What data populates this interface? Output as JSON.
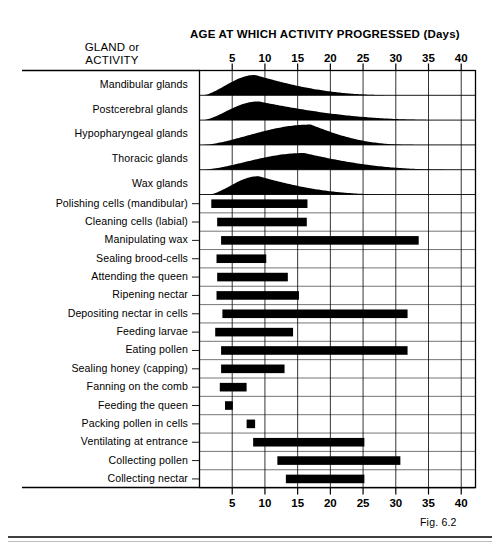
{
  "figure": {
    "caption": "Fig. 6.2",
    "column_header": {
      "line1": "GLAND or",
      "line2": "ACTIVITY"
    },
    "axis_title": "AGE AT WHICH ACTIVITY PROGRESSED (Days)"
  },
  "chart_data": {
    "type": "bar",
    "title": "AGE AT WHICH ACTIVITY PROGRESSED (Days)",
    "xlabel": "Age (days)",
    "ylabel": "GLAND or ACTIVITY",
    "xlim": [
      0,
      42
    ],
    "ticks": [
      5,
      10,
      15,
      20,
      25,
      30,
      35,
      40
    ],
    "tick_labels": [
      "5",
      "10",
      "15",
      "20",
      "25",
      "30",
      "35",
      "40"
    ],
    "grid": true,
    "legend": "none",
    "axis_top_labels": [
      "5",
      "10",
      "15",
      "20",
      "25",
      "30",
      "35",
      "40"
    ],
    "axis_bottom_labels": [
      "5",
      "10",
      "15",
      "20",
      "25",
      "30",
      "35",
      "40"
    ],
    "categories": [
      "Mandibular glands",
      "Postcerebral glands",
      "Hypopharyngeal glands",
      "Thoracic glands",
      "Wax glands",
      "Polishing cells (mandibular)",
      "Cleaning cells (labial)",
      "Manipulating wax",
      "Sealing brood-cells",
      "Attending the queen",
      "Ripening nectar",
      "Depositing nectar in cells",
      "Feeding larvae",
      "Eating pollen",
      "Sealing honey (capping)",
      "Fanning on the comb",
      "Feeding the queen",
      "Packing pollen in cells",
      "Ventilating at entrance",
      "Collecting pollen",
      "Collecting nectar"
    ],
    "gland_curves": [
      {
        "label": "Mandibular glands",
        "start": 0.5,
        "peak": 8.5,
        "end": 32.0,
        "peak_height": 1.0
      },
      {
        "label": "Postcerebral glands",
        "start": 0.5,
        "peak": 9.0,
        "end": 40.5,
        "peak_height": 0.92
      },
      {
        "label": "Hypopharyngeal glands",
        "start": 0.5,
        "peak": 17.0,
        "end": 34.0,
        "peak_height": 1.0
      },
      {
        "label": "Thoracic glands",
        "start": 0.5,
        "peak": 16.0,
        "end": 40.5,
        "peak_height": 0.82
      },
      {
        "label": "Wax glands",
        "start": 1.5,
        "peak": 9.0,
        "end": 31.0,
        "peak_height": 0.9
      }
    ],
    "activity_bars": [
      {
        "label": "Polishing cells (mandibular)",
        "start": 1.8,
        "end": 16.5
      },
      {
        "label": "Cleaning cells (labial)",
        "start": 2.7,
        "end": 16.4
      },
      {
        "label": "Manipulating wax",
        "start": 3.3,
        "end": 33.5
      },
      {
        "label": "Sealing brood-cells",
        "start": 2.6,
        "end": 10.2
      },
      {
        "label": "Attending the queen",
        "start": 2.7,
        "end": 13.5
      },
      {
        "label": "Ripening nectar",
        "start": 2.6,
        "end": 15.2
      },
      {
        "label": "Depositing nectar in cells",
        "start": 3.5,
        "end": 31.8
      },
      {
        "label": "Feeding larvae",
        "start": 2.4,
        "end": 14.3
      },
      {
        "label": "Eating pollen",
        "start": 3.3,
        "end": 31.8
      },
      {
        "label": "Sealing honey (capping)",
        "start": 3.3,
        "end": 13.0
      },
      {
        "label": "Fanning on the comb",
        "start": 3.1,
        "end": 7.2
      },
      {
        "label": "Feeding the queen",
        "start": 3.9,
        "end": 5.1
      },
      {
        "label": "Packing pollen in cells",
        "start": 7.2,
        "end": 8.5
      },
      {
        "label": "Ventilating at entrance",
        "start": 8.2,
        "end": 25.2
      },
      {
        "label": "Collecting pollen",
        "start": 11.9,
        "end": 30.7
      },
      {
        "label": "Collecting nectar",
        "start": 13.2,
        "end": 25.2
      }
    ]
  }
}
